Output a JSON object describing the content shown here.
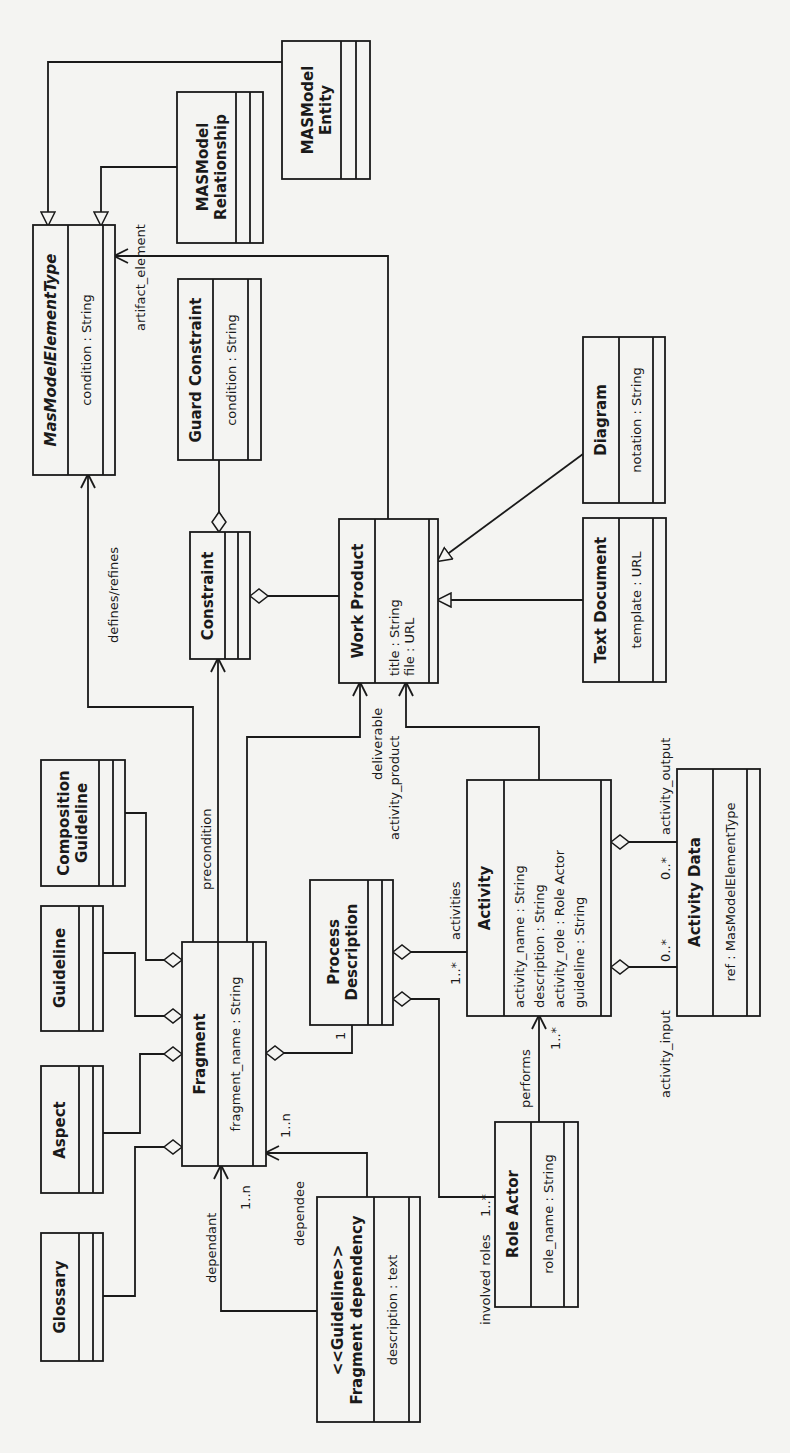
{
  "diagram": {
    "orientation": "rotated 90° counter-clockwise",
    "classes": {
      "mas_model_element_type": {
        "name": "MasModelElementType",
        "italic": true,
        "attributes": [
          "condition : String"
        ]
      },
      "masmodel_relationship": {
        "name_line1": "MASModel",
        "name_line2": "Relationship",
        "attributes": []
      },
      "masmodel_entity": {
        "name_line1": "MASModel",
        "name_line2": "Entity",
        "attributes": []
      },
      "guard_constraint": {
        "name": "Guard Constraint",
        "attributes": [
          "condition : String"
        ]
      },
      "constraint": {
        "name": "Constraint",
        "attributes": []
      },
      "work_product": {
        "name": "Work Product",
        "attributes": [
          "title : String",
          "file : URL"
        ]
      },
      "diagram": {
        "name": "Diagram",
        "attributes": [
          "notation : String"
        ]
      },
      "text_document": {
        "name": "Text Document",
        "attributes": [
          "template : URL"
        ]
      },
      "composition_guideline": {
        "name_line1": "Composition",
        "name_line2": "Guideline",
        "attributes": []
      },
      "guideline": {
        "name": "Guideline",
        "attributes": []
      },
      "aspect": {
        "name": "Aspect",
        "attributes": []
      },
      "glossary": {
        "name": "Glossary",
        "attributes": []
      },
      "fragment": {
        "name": "Fragment",
        "attributes": [
          "fragment_name : String"
        ]
      },
      "process_description": {
        "name_line1": "Process",
        "name_line2": "Description",
        "attributes": []
      },
      "activity": {
        "name": "Activity",
        "attributes": [
          "activity_name : String",
          "description : String",
          "activity_role : Role Actor",
          "guideline : String"
        ]
      },
      "activity_data": {
        "name": "Activity Data",
        "attributes": [
          "ref : MasModelElementType"
        ]
      },
      "role_actor": {
        "name": "Role Actor",
        "attributes": [
          "role_name : String"
        ]
      },
      "fragment_dependency": {
        "stereotype": "<<Guideline>>",
        "name": "Fragment dependency",
        "attributes": [
          "description : text"
        ]
      }
    },
    "relationships": {
      "artifact_element": "artifact_element",
      "defines_refines": "defines/refines",
      "precondition": "precondition",
      "deliverable": "deliverable",
      "activity_product": "activity_product",
      "activities": "activities",
      "activities_mult": "1..*",
      "process_mult": "1",
      "activity_output": "activity_output",
      "activity_output_mult": "0..*",
      "activity_input": "activity_input",
      "activity_input_mult": "0..*",
      "performs": "performs",
      "performs_mult": "1..*",
      "involved_roles": "involved roles",
      "involved_roles_mult": "1..*",
      "dependant": "dependant",
      "dependant_mult": "1..n",
      "dependee": "dependee",
      "dependee_mult": "1..n"
    }
  }
}
